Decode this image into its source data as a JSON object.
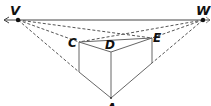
{
  "diagram": {
    "type": "two-point perspective",
    "labels": {
      "v": "V",
      "w": "W",
      "c": "C",
      "d": "D",
      "e": "E",
      "a": "A"
    },
    "colors": {
      "line": "#555555",
      "dashed": "#555555",
      "horizon": "#444444",
      "point": "#111111"
    }
  }
}
